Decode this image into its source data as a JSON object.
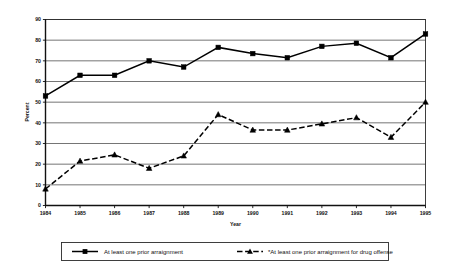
{
  "chart_data": {
    "type": "line",
    "title": "",
    "xlabel": "Year",
    "ylabel": "Percent",
    "categories": [
      "1984",
      "1985",
      "1986",
      "1987",
      "1988",
      "1989",
      "1990",
      "1991",
      "1992",
      "1993",
      "1994",
      "1995"
    ],
    "xlim": [
      1984,
      1995
    ],
    "ylim": [
      0,
      90
    ],
    "ytick_step": 10,
    "yticks": [
      "0",
      "10",
      "20",
      "30",
      "40",
      "50",
      "60",
      "70",
      "80",
      "90"
    ],
    "grid": "horizontal",
    "legend_position": "bottom",
    "series": [
      {
        "name": "At least one prior arraignment",
        "marker": "square",
        "line_style": "solid",
        "color": "#000000",
        "values": [
          53,
          63,
          63,
          70,
          67,
          76.5,
          73.5,
          71.5,
          77,
          78.5,
          71.5,
          83
        ]
      },
      {
        "name": "*At least one prior arraignment for drug offense",
        "marker": "triangle",
        "line_style": "dashed",
        "color": "#000000",
        "values": [
          8,
          21.5,
          24.5,
          18,
          24,
          44,
          36.5,
          36.5,
          39.5,
          42.5,
          33,
          50
        ]
      }
    ]
  },
  "legend": {
    "items": [
      {
        "label": "At least one prior arraignment"
      },
      {
        "label": "*At least one prior arraignment for drug offense"
      }
    ]
  },
  "axes": {
    "y_title": "Percent",
    "x_title": "Year"
  }
}
